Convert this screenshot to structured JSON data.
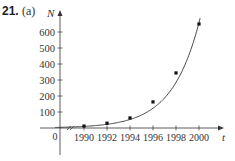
{
  "problem": {
    "number": "21.",
    "part": "(a)"
  },
  "chart_data": {
    "type": "scatter",
    "title": "",
    "xlabel": "t",
    "ylabel": "N",
    "x_ticks": [
      1990,
      1992,
      1994,
      1996,
      1998,
      2000
    ],
    "y_ticks": [
      0,
      100,
      200,
      300,
      400,
      500,
      600
    ],
    "xlim": [
      1985,
      2002
    ],
    "ylim": [
      0,
      680
    ],
    "axis_break_on_x": true,
    "origin_label": "0",
    "grid": false,
    "legend": null,
    "series": [
      {
        "name": "data",
        "kind": "points",
        "x": [
          1990,
          1992,
          1994,
          1996,
          1998,
          2000
        ],
        "y": [
          12,
          30,
          63,
          163,
          344,
          650
        ]
      },
      {
        "name": "exponential fit",
        "kind": "curve",
        "model": "N = a*b^(t-1990)",
        "a": 10,
        "b": 1.52,
        "x_range": [
          1987.5,
          2000.1
        ]
      }
    ]
  },
  "colors": {
    "axis": "#333333",
    "curve": "#333333",
    "points": "#111111",
    "text": "#333333"
  }
}
